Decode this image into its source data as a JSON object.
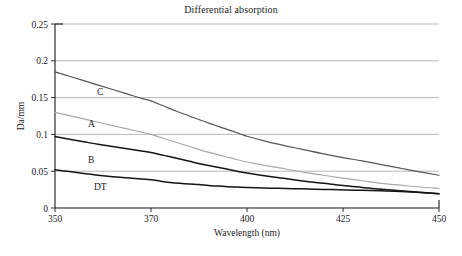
{
  "figure": {
    "title": "Differential absorption",
    "background": "#ffffff"
  },
  "axes": {
    "x_title": "Wavelength (nm)",
    "y_title": "Da/mm",
    "x_ticks": [
      "350",
      "370",
      "400",
      "425",
      "450"
    ],
    "y_ticks": [
      "0",
      "0.05",
      "0.1",
      "0.15",
      "0.2",
      "0.25"
    ]
  },
  "series_labels": {
    "c": "C",
    "a": "A",
    "b": "B",
    "dt": "DT"
  },
  "chart_data": {
    "type": "line",
    "title": "Differential absorption",
    "xlabel": "Wavelength (nm)",
    "ylabel": "Da/mm",
    "xlim": [
      350,
      450
    ],
    "ylim": [
      0,
      0.25
    ],
    "x_tick_values": [
      350,
      370,
      400,
      425,
      450
    ],
    "x_tick_positions_fraction": [
      0.0,
      0.25,
      0.5,
      0.75,
      1.0
    ],
    "y_tick_values": [
      0,
      0.05,
      0.1,
      0.15,
      0.2,
      0.25
    ],
    "grid": "horizontal",
    "legend": "inline-labels",
    "colors": {
      "C": "#565656",
      "A": "#a8a8a8",
      "B": "#151515",
      "DT": "#151515"
    },
    "series": [
      {
        "name": "C",
        "color": "#565656",
        "x": [
          350,
          353,
          356,
          359,
          362,
          365,
          368,
          370,
          374,
          378,
          382,
          386,
          390,
          394,
          398,
          400,
          405,
          410,
          415,
          420,
          425,
          430,
          435,
          440,
          445,
          450
        ],
        "values": [
          0.185,
          0.179,
          0.173,
          0.167,
          0.161,
          0.155,
          0.149,
          0.1455,
          0.1385,
          0.1315,
          0.125,
          0.1185,
          0.1125,
          0.1065,
          0.1005,
          0.0975,
          0.0905,
          0.0845,
          0.079,
          0.0735,
          0.0685,
          0.064,
          0.059,
          0.054,
          0.049,
          0.0445
        ]
      },
      {
        "name": "A",
        "color": "#a8a8a8",
        "x": [
          350,
          353,
          356,
          359,
          362,
          365,
          368,
          370,
          374,
          378,
          382,
          386,
          390,
          394,
          398,
          400,
          405,
          410,
          415,
          420,
          425,
          430,
          435,
          440,
          445,
          450
        ],
        "values": [
          0.13,
          0.1255,
          0.121,
          0.1165,
          0.112,
          0.1075,
          0.103,
          0.1,
          0.0945,
          0.089,
          0.0835,
          0.078,
          0.0735,
          0.069,
          0.0645,
          0.0625,
          0.0575,
          0.053,
          0.0485,
          0.0445,
          0.0405,
          0.037,
          0.0335,
          0.031,
          0.0285,
          0.0265
        ]
      },
      {
        "name": "B",
        "color": "#151515",
        "x": [
          350,
          353,
          356,
          359,
          362,
          365,
          368,
          370,
          374,
          378,
          382,
          386,
          390,
          394,
          398,
          400,
          405,
          410,
          415,
          420,
          425,
          430,
          435,
          440,
          445,
          450
        ],
        "values": [
          0.097,
          0.0935,
          0.09,
          0.0865,
          0.0835,
          0.0805,
          0.0775,
          0.0755,
          0.0715,
          0.0675,
          0.0635,
          0.0595,
          0.056,
          0.0525,
          0.049,
          0.0475,
          0.0435,
          0.04,
          0.0365,
          0.0335,
          0.0305,
          0.028,
          0.0255,
          0.0235,
          0.0215,
          0.0195
        ]
      },
      {
        "name": "DT",
        "color": "#151515",
        "x": [
          350,
          353,
          356,
          359,
          362,
          365,
          368,
          370,
          373,
          376,
          379,
          382,
          385,
          388,
          391,
          394,
          397,
          400,
          404,
          408,
          412,
          416,
          420,
          424,
          428,
          432,
          436,
          440,
          444,
          447,
          450
        ],
        "values": [
          0.052,
          0.0495,
          0.047,
          0.0445,
          0.0425,
          0.041,
          0.0395,
          0.0385,
          0.0365,
          0.0348,
          0.0335,
          0.0325,
          0.0318,
          0.0305,
          0.0298,
          0.029,
          0.0285,
          0.028,
          0.0272,
          0.0268,
          0.0262,
          0.0258,
          0.0252,
          0.0248,
          0.0242,
          0.0238,
          0.0232,
          0.0225,
          0.0215,
          0.0205,
          0.0195
        ]
      }
    ]
  }
}
